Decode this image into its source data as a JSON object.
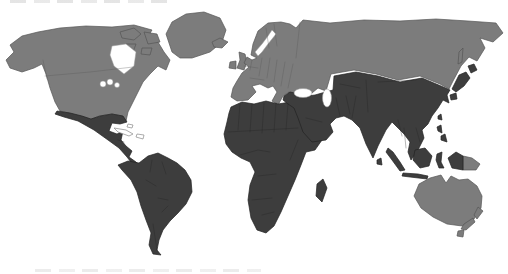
{
  "map": {
    "description": "World choropleth map, countries shaded in two gray tones",
    "ocean_color": "#ffffff",
    "coast_stroke_width": 0.7,
    "categories": {
      "light": {
        "color": "#7c7c7c",
        "border": "#565656",
        "label": "light-gray shaded countries"
      },
      "dark": {
        "color": "#3d3d3d",
        "border": "#232323",
        "label": "dark-gray shaded countries"
      },
      "uncolored": {
        "color": "#ffffff",
        "border": "#8a8a8a",
        "label": "uncolored islands"
      }
    },
    "regions": [
      {
        "id": "north-america",
        "category": "light"
      },
      {
        "id": "arctic-island-1",
        "category": "light"
      },
      {
        "id": "arctic-island-2",
        "category": "light"
      },
      {
        "id": "arctic-island-3",
        "category": "light"
      },
      {
        "id": "arctic-island-4",
        "category": "light"
      },
      {
        "id": "greenland",
        "category": "light"
      },
      {
        "id": "iceland",
        "category": "light"
      },
      {
        "id": "great-britain",
        "category": "light"
      },
      {
        "id": "ireland",
        "category": "light"
      },
      {
        "id": "eurasia-north",
        "category": "light"
      },
      {
        "id": "sakhalin",
        "category": "light"
      },
      {
        "id": "australia",
        "category": "light"
      },
      {
        "id": "tasmania",
        "category": "light"
      },
      {
        "id": "papua-new-guinea",
        "category": "light"
      },
      {
        "id": "new-zealand-north",
        "category": "light"
      },
      {
        "id": "new-zealand-south",
        "category": "light"
      },
      {
        "id": "mexico-central-america",
        "category": "dark"
      },
      {
        "id": "south-america",
        "category": "dark"
      },
      {
        "id": "africa",
        "category": "dark"
      },
      {
        "id": "madagascar",
        "category": "dark"
      },
      {
        "id": "middle-east-asia",
        "category": "dark"
      },
      {
        "id": "japan-hokkaido",
        "category": "dark"
      },
      {
        "id": "japan-honshu",
        "category": "dark"
      },
      {
        "id": "japan-kyushu",
        "category": "dark"
      },
      {
        "id": "taiwan",
        "category": "dark"
      },
      {
        "id": "philippines-north",
        "category": "dark"
      },
      {
        "id": "philippines-south",
        "category": "dark"
      },
      {
        "id": "sri-lanka",
        "category": "dark"
      },
      {
        "id": "sumatra",
        "category": "dark"
      },
      {
        "id": "java",
        "category": "dark"
      },
      {
        "id": "borneo",
        "category": "dark"
      },
      {
        "id": "sulawesi",
        "category": "dark"
      },
      {
        "id": "west-new-guinea",
        "category": "dark"
      },
      {
        "id": "cuba",
        "category": "uncolored"
      },
      {
        "id": "hispaniola",
        "category": "uncolored"
      },
      {
        "id": "bahamas",
        "category": "uncolored"
      }
    ],
    "water_bodies": [
      "hudson-bay",
      "great-lake-1",
      "great-lake-2",
      "great-lake-3",
      "baltic-sea",
      "black-sea",
      "caspian-sea"
    ]
  },
  "artifacts": {
    "top_edge": "faint fragment of cropped text above the map (unreadable)",
    "bottom_edge": "faint fragment of cropped text below the map (unreadable)"
  }
}
